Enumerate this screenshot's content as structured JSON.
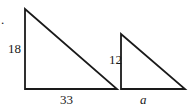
{
  "figure": {
    "marker": ".",
    "triangle_large": {
      "vertical_side_label": "18",
      "horizontal_side_label": "33"
    },
    "triangle_small": {
      "vertical_side_label": "12",
      "horizontal_side_label": "a"
    },
    "stroke_color": "#1a1a1a"
  }
}
